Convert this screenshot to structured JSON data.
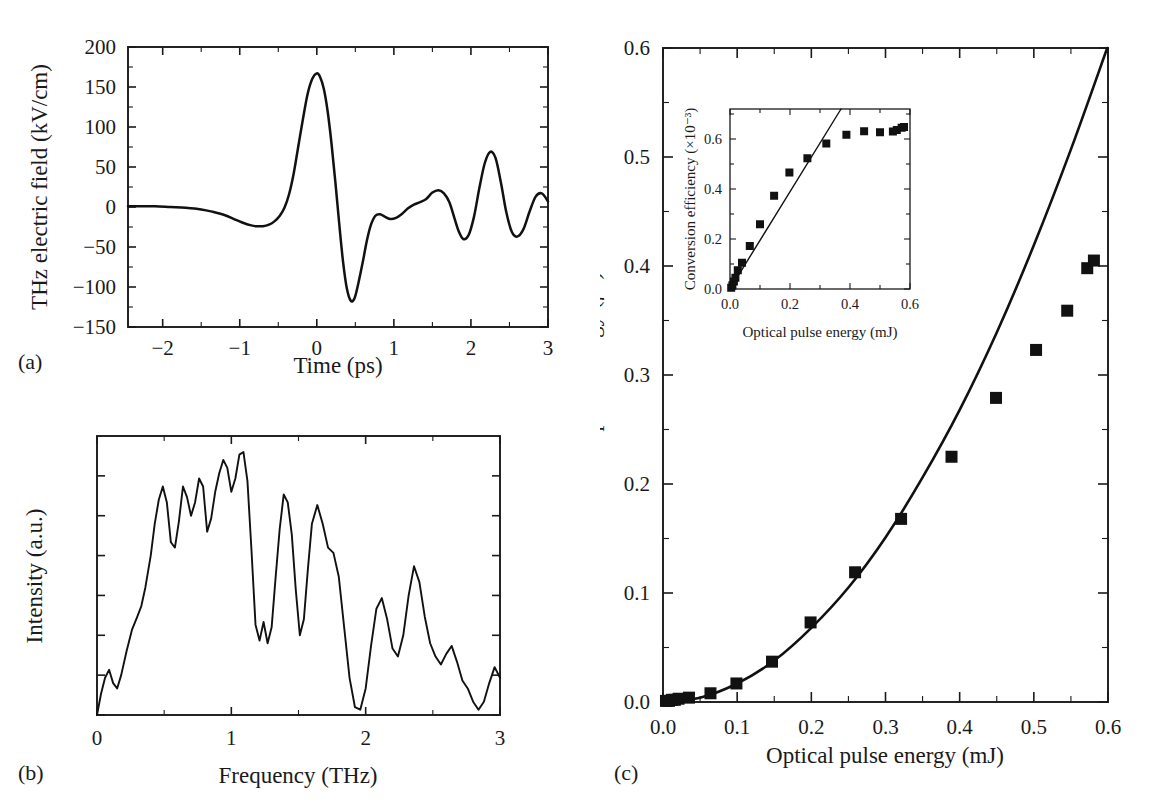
{
  "figure": {
    "background": "#ffffff",
    "foreground": "#111111",
    "panels": [
      {
        "label": "(a)"
      },
      {
        "label": "(b)"
      },
      {
        "label": "(c)"
      }
    ]
  },
  "chart_data": [
    {
      "id": "panel-a",
      "panel_label": "(a)",
      "type": "line",
      "title": "",
      "xlabel": "Time (ps)",
      "ylabel": "THz electric field (kV/cm)",
      "xlim": [
        -2.45,
        3.0
      ],
      "ylim": [
        -150,
        200
      ],
      "xticks": [
        -2,
        -1,
        0,
        1,
        2,
        3
      ],
      "xticklabels": [
        "−2",
        "−1",
        "0",
        "1",
        "2",
        "3"
      ],
      "yticks": [
        -150,
        -100,
        -50,
        0,
        50,
        100,
        150,
        200
      ],
      "yticklabels": [
        "−150",
        "−100",
        "−50",
        "0",
        "50",
        "100",
        "150",
        "200"
      ],
      "grid": false,
      "legend": null,
      "series": [
        {
          "name": "THz electric field waveform",
          "x": [
            -2.45,
            -2.3,
            -2.1,
            -1.9,
            -1.7,
            -1.5,
            -1.35,
            -1.2,
            -1.05,
            -0.95,
            -0.85,
            -0.78,
            -0.7,
            -0.62,
            -0.55,
            -0.48,
            -0.42,
            -0.36,
            -0.3,
            -0.24,
            -0.18,
            -0.12,
            -0.06,
            0.0,
            0.04,
            0.09,
            0.14,
            0.19,
            0.24,
            0.29,
            0.34,
            0.39,
            0.44,
            0.49,
            0.54,
            0.6,
            0.65,
            0.7,
            0.76,
            0.82,
            0.88,
            0.95,
            1.02,
            1.1,
            1.18,
            1.26,
            1.34,
            1.42,
            1.5,
            1.58,
            1.65,
            1.72,
            1.78,
            1.84,
            1.9,
            1.97,
            2.04,
            2.11,
            2.18,
            2.25,
            2.32,
            2.39,
            2.46,
            2.53,
            2.6,
            2.68,
            2.76,
            2.84,
            2.92,
            3.0
          ],
          "y": [
            1,
            1,
            1,
            0,
            -1,
            -3,
            -6,
            -10,
            -16,
            -20,
            -23,
            -24,
            -24,
            -22,
            -18,
            -11,
            -1,
            16,
            42,
            76,
            110,
            141,
            160,
            167,
            163,
            148,
            120,
            80,
            32,
            -20,
            -68,
            -102,
            -117,
            -114,
            -95,
            -67,
            -42,
            -23,
            -11,
            -9,
            -12,
            -15,
            -14,
            -9,
            -2,
            3,
            6,
            10,
            18,
            21,
            17,
            6,
            -12,
            -30,
            -40,
            -35,
            -12,
            24,
            55,
            69,
            61,
            30,
            -7,
            -31,
            -37,
            -28,
            -6,
            13,
            17,
            7
          ],
          "peak_positive": {
            "x": 0.0,
            "y": 167
          },
          "peak_negative": {
            "x": 0.44,
            "y": -117
          }
        }
      ]
    },
    {
      "id": "panel-b",
      "panel_label": "(b)",
      "type": "line",
      "title": "",
      "xlabel": "Frequency (THz)",
      "ylabel": "Intensity (a.u.)",
      "xlim": [
        0,
        3
      ],
      "ylim": [
        0,
        1.05
      ],
      "xticks": [
        0,
        1,
        2,
        3
      ],
      "xticklabels": [
        "0",
        "1",
        "2",
        "3"
      ],
      "yticks": [
        0.0,
        0.15,
        0.3,
        0.45,
        0.6,
        0.75,
        0.9
      ],
      "yticklabels": [
        "",
        "",
        "",
        "",
        "",
        "",
        ""
      ],
      "grid": false,
      "legend": null,
      "series": [
        {
          "name": "THz spectral intensity",
          "x": [
            0.0,
            0.03,
            0.06,
            0.09,
            0.12,
            0.15,
            0.18,
            0.22,
            0.26,
            0.3,
            0.33,
            0.36,
            0.4,
            0.43,
            0.46,
            0.49,
            0.52,
            0.55,
            0.58,
            0.61,
            0.64,
            0.67,
            0.7,
            0.73,
            0.76,
            0.79,
            0.82,
            0.85,
            0.88,
            0.91,
            0.94,
            0.97,
            1.0,
            1.03,
            1.06,
            1.09,
            1.12,
            1.15,
            1.18,
            1.21,
            1.24,
            1.27,
            1.3,
            1.33,
            1.36,
            1.39,
            1.42,
            1.45,
            1.48,
            1.51,
            1.54,
            1.57,
            1.6,
            1.64,
            1.68,
            1.72,
            1.76,
            1.8,
            1.84,
            1.88,
            1.92,
            1.96,
            2.0,
            2.04,
            2.08,
            2.12,
            2.16,
            2.2,
            2.24,
            2.28,
            2.32,
            2.36,
            2.4,
            2.44,
            2.48,
            2.52,
            2.56,
            2.6,
            2.64,
            2.68,
            2.72,
            2.76,
            2.8,
            2.84,
            2.88,
            2.92,
            2.96,
            3.0
          ],
          "y": [
            0.0,
            0.08,
            0.14,
            0.17,
            0.12,
            0.1,
            0.15,
            0.24,
            0.32,
            0.37,
            0.41,
            0.48,
            0.6,
            0.72,
            0.81,
            0.86,
            0.8,
            0.65,
            0.63,
            0.73,
            0.86,
            0.82,
            0.75,
            0.8,
            0.89,
            0.86,
            0.69,
            0.74,
            0.84,
            0.91,
            0.96,
            0.93,
            0.84,
            0.89,
            0.98,
            0.99,
            0.88,
            0.62,
            0.34,
            0.28,
            0.35,
            0.27,
            0.33,
            0.52,
            0.7,
            0.83,
            0.8,
            0.68,
            0.47,
            0.3,
            0.36,
            0.55,
            0.72,
            0.79,
            0.72,
            0.63,
            0.61,
            0.52,
            0.33,
            0.14,
            0.03,
            0.02,
            0.1,
            0.26,
            0.4,
            0.44,
            0.36,
            0.25,
            0.22,
            0.3,
            0.45,
            0.56,
            0.5,
            0.37,
            0.27,
            0.22,
            0.19,
            0.23,
            0.26,
            0.2,
            0.13,
            0.1,
            0.05,
            0.02,
            0.05,
            0.12,
            0.18,
            0.14,
            0.07,
            0.05,
            0.08,
            0.12,
            0.1,
            0.06,
            0.04,
            0.06,
            0.09,
            0.07,
            0.05,
            0.06,
            0.08,
            0.06,
            0.05,
            0.06
          ]
        }
      ]
    },
    {
      "id": "panel-c",
      "panel_label": "(c)",
      "type": "scatter",
      "title": "",
      "xlabel": "Optical pulse energy (mJ)",
      "ylabel": "THz pulse energy (µJ)",
      "xlim": [
        0.0,
        0.6
      ],
      "ylim": [
        0.0,
        0.6
      ],
      "xticks": [
        0.0,
        0.1,
        0.2,
        0.3,
        0.4,
        0.5,
        0.6
      ],
      "xticklabels": [
        "0.0",
        "0.1",
        "0.2",
        "0.3",
        "0.4",
        "0.5",
        "0.6"
      ],
      "yticks": [
        0.0,
        0.1,
        0.2,
        0.3,
        0.4,
        0.5,
        0.6
      ],
      "yticklabels": [
        "0.0",
        "0.1",
        "0.2",
        "0.3",
        "0.4",
        "0.5",
        "0.6"
      ],
      "grid": false,
      "legend": null,
      "series": [
        {
          "name": "Measured THz pulse energy",
          "marker": "filled-square",
          "x": [
            0.004,
            0.008,
            0.012,
            0.016,
            0.021,
            0.035,
            0.064,
            0.099,
            0.147,
            0.199,
            0.259,
            0.321,
            0.389,
            0.449,
            0.503,
            0.545,
            0.572,
            0.581
          ],
          "y": [
            0.001,
            0.001,
            0.002,
            0.002,
            0.003,
            0.004,
            0.008,
            0.017,
            0.037,
            0.073,
            0.119,
            0.168,
            0.225,
            0.279,
            0.323,
            0.359,
            0.398,
            0.405
          ]
        },
        {
          "name": "Quadratic fit",
          "type": "line",
          "description": "Quadratic fit through origin extending to top of frame",
          "x": [
            0.0,
            0.05,
            0.1,
            0.15,
            0.2,
            0.25,
            0.3,
            0.35,
            0.4,
            0.45,
            0.5,
            0.55,
            0.6
          ],
          "y": [
            0.0,
            0.004,
            0.017,
            0.038,
            0.068,
            0.105,
            0.151,
            0.206,
            0.268,
            0.339,
            0.419,
            0.507,
            0.602
          ]
        }
      ]
    },
    {
      "id": "panel-c-inset",
      "panel_label": "",
      "type": "scatter",
      "title": "",
      "xlabel": "Optical pulse energy (mJ)",
      "ylabel": "Conversion efficiency (×10⁻³)",
      "xlim": [
        0.0,
        0.6
      ],
      "ylim": [
        0.0,
        0.72
      ],
      "xticks": [
        0.0,
        0.1,
        0.2,
        0.3,
        0.4,
        0.5,
        0.6
      ],
      "xticklabels": [
        "0.0",
        "",
        "0.2",
        "",
        "0.4",
        "",
        "0.6"
      ],
      "yticks": [
        0.0,
        0.2,
        0.4,
        0.6
      ],
      "yticklabels": [
        "0.0",
        "0.2",
        "0.4",
        "0.6"
      ],
      "grid": false,
      "legend": null,
      "series": [
        {
          "name": "Conversion efficiency",
          "marker": "filled-square",
          "x": [
            0.004,
            0.008,
            0.013,
            0.018,
            0.026,
            0.04,
            0.066,
            0.1,
            0.147,
            0.198,
            0.258,
            0.321,
            0.388,
            0.447,
            0.5,
            0.543,
            0.556,
            0.572,
            0.58
          ],
          "y": [
            0.005,
            0.015,
            0.03,
            0.045,
            0.075,
            0.105,
            0.172,
            0.259,
            0.373,
            0.466,
            0.523,
            0.582,
            0.617,
            0.631,
            0.627,
            0.63,
            0.636,
            0.645,
            0.648
          ]
        },
        {
          "name": "Linear fit",
          "type": "line",
          "description": "Linear fit through origin exiting at top of inset frame",
          "x": [
            0.0,
            0.37
          ],
          "y": [
            0.0,
            0.72
          ]
        }
      ]
    }
  ]
}
